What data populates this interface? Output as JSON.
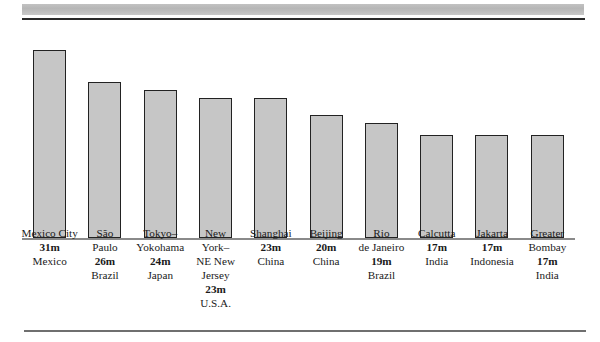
{
  "chart_data": {
    "type": "bar",
    "title": "",
    "subtitle": "",
    "xlabel": "",
    "ylabel": "",
    "grid": false,
    "legend": "none",
    "ylim": [
      0,
      33
    ],
    "unit": "m",
    "unit_meaning": "millions",
    "categories": [
      "Mexico City",
      "São Paulo",
      "Tokyo–Yokohama",
      "New York–NE New Jersey",
      "Shanghai",
      "Beijing",
      "Rio de Janeiro",
      "Calcutta",
      "Jakarta",
      "Greater Bombay"
    ],
    "values": [
      31,
      26,
      24,
      23,
      23,
      20,
      19,
      17,
      17,
      17
    ],
    "countries": [
      "Mexico",
      "Brazil",
      "Japan",
      "U.S.A.",
      "China",
      "China",
      "Brazil",
      "India",
      "Indonesia",
      "India"
    ]
  },
  "bars": [
    {
      "name_lines": [
        "Mexico City"
      ],
      "population_label": "31m",
      "country": "Mexico",
      "value": 31
    },
    {
      "name_lines": [
        "São",
        "Paulo"
      ],
      "population_label": "26m",
      "country": "Brazil",
      "value": 26
    },
    {
      "name_lines": [
        "Tokyo–",
        "Yokohama"
      ],
      "population_label": "24m",
      "country": "Japan",
      "value": 24
    },
    {
      "name_lines": [
        "New",
        "York–",
        "NE New",
        "Jersey"
      ],
      "population_label": "23m",
      "country": "U.S.A.",
      "value": 23
    },
    {
      "name_lines": [
        "Shanghai"
      ],
      "population_label": "23m",
      "country": "China",
      "value": 23
    },
    {
      "name_lines": [
        "Beijing"
      ],
      "population_label": "20m",
      "country": "China",
      "value": 20
    },
    {
      "name_lines": [
        "Rio",
        "de Janeiro"
      ],
      "population_label": "19m",
      "country": "Brazil",
      "value": 19
    },
    {
      "name_lines": [
        "Calcutta"
      ],
      "population_label": "17m",
      "country": "India",
      "value": 17
    },
    {
      "name_lines": [
        "Jakarta"
      ],
      "population_label": "17m",
      "country": "Indonesia",
      "value": 17
    },
    {
      "name_lines": [
        "Greater",
        "Bombay"
      ],
      "population_label": "17m",
      "country": "India",
      "value": 17
    }
  ],
  "geometry": {
    "bar_tops_px": [
      30,
      62,
      70,
      78,
      78,
      95,
      103,
      115,
      115,
      115
    ],
    "baseline_px": 218
  },
  "colors": {
    "bar_fill": "#c6c6c6",
    "bar_stroke": "#222222",
    "band": "#bdbdbd",
    "rule_top": "#2b2b2b",
    "rule_bottom": "#6f6f6f",
    "text": "#1a1a1a",
    "background": "#ffffff"
  }
}
